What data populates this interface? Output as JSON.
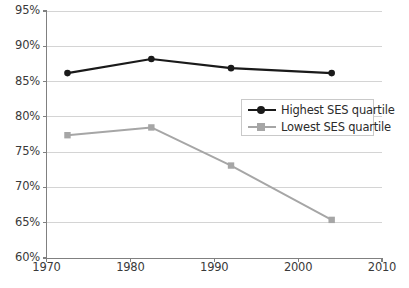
{
  "chart_data": {
    "type": "line",
    "title": "",
    "subtitle": "",
    "xlabel": "",
    "ylabel": "",
    "xlim": [
      1970,
      2010
    ],
    "ylim": [
      60,
      95
    ],
    "grid": true,
    "grid_axis": "y",
    "legend_position": "center-right",
    "x_tick_labels": [
      "1970",
      "1980",
      "1990",
      "2000",
      "2010"
    ],
    "x_ticks": [
      1970,
      1980,
      1990,
      2000,
      2010
    ],
    "y_tick_labels": [
      "60%",
      "65%",
      "70%",
      "75%",
      "80%",
      "85%",
      "90%",
      "95%"
    ],
    "y_ticks": [
      60,
      65,
      70,
      75,
      80,
      85,
      90,
      95
    ],
    "y_unit": "%",
    "series": [
      {
        "name": "Highest SES quartile",
        "color": "#1a1a1a",
        "marker": "circle",
        "x": [
          1972.5,
          1982.5,
          1992,
          2004
        ],
        "values": [
          86.2,
          88.2,
          86.9,
          86.2
        ]
      },
      {
        "name": "Lowest SES quartile",
        "color": "#a6a6a6",
        "marker": "square",
        "x": [
          1972.5,
          1982.5,
          1992,
          2004
        ],
        "values": [
          77.4,
          78.5,
          73.1,
          65.4
        ]
      }
    ]
  },
  "legend": {
    "entries": [
      {
        "label": "Highest SES quartile"
      },
      {
        "label": "Lowest SES quartile"
      }
    ]
  },
  "colors": {
    "series_high": "#1a1a1a",
    "series_low": "#a6a6a6",
    "axis": "#808080",
    "grid": "#d4d4d4",
    "text": "#3a3a3a"
  }
}
